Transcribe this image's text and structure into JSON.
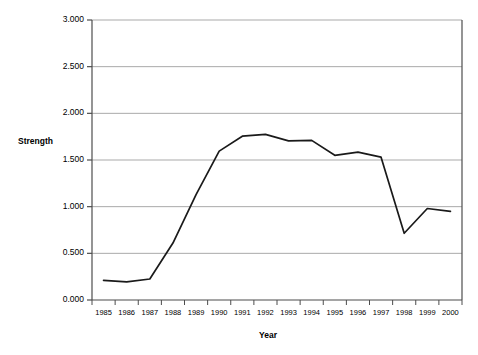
{
  "chart_data": {
    "type": "line",
    "title": "",
    "xlabel": "Year",
    "ylabel": "Strength",
    "categories": [
      "1985",
      "1986",
      "1987",
      "1988",
      "1989",
      "1990",
      "1991",
      "1992",
      "1993",
      "1994",
      "1995",
      "1996",
      "1997",
      "1998",
      "1999",
      "2000"
    ],
    "values": [
      0.21,
      0.195,
      0.225,
      0.61,
      1.13,
      1.595,
      1.755,
      1.775,
      1.705,
      1.71,
      1.55,
      1.585,
      1.53,
      0.715,
      0.98,
      0.95
    ],
    "series": [
      {
        "name": "Strength",
        "values": [
          0.21,
          0.195,
          0.225,
          0.61,
          1.13,
          1.595,
          1.755,
          1.775,
          1.705,
          1.71,
          1.55,
          1.585,
          1.53,
          0.715,
          0.98,
          0.95
        ]
      }
    ],
    "ylim": [
      0.0,
      3.0
    ],
    "ytick_labels": [
      "0.000",
      "0.500",
      "1.000",
      "1.500",
      "2.000",
      "2.500",
      "3.000"
    ],
    "ytick_values": [
      0.0,
      0.5,
      1.0,
      1.5,
      2.0,
      2.5,
      3.0
    ],
    "grid": true,
    "grid_axis": "y",
    "legend": "none",
    "line_color": "#1a1a1a",
    "grid_color": "#a9a9a9",
    "axis_color": "#4d4d4d",
    "background_color": "#ffffff"
  },
  "axes": {
    "y_title": "Strength",
    "x_title": "Year"
  }
}
